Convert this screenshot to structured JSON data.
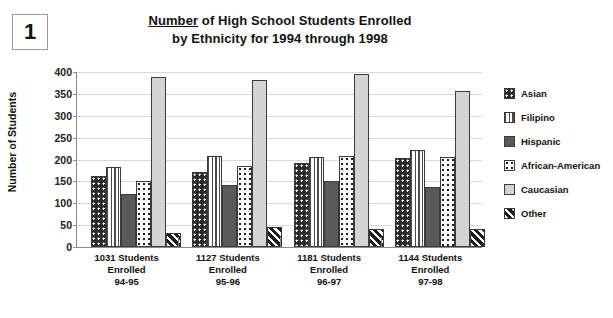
{
  "figure": {
    "number": "1"
  },
  "title": {
    "underlined_word": "Number",
    "line1_rest": " of High School Students Enrolled",
    "line2": "by Ethnicity for 1994 through 1998",
    "full": "Number of High School Students Enrolled by Ethnicity for 1994 through 1998"
  },
  "axes": {
    "ylabel": "Number of Students",
    "yticks": [
      "400",
      "350",
      "300",
      "250",
      "200",
      "150",
      "100",
      "50",
      "0"
    ]
  },
  "legend": {
    "position": "right",
    "items": [
      {
        "label": "Asian",
        "pattern": "dark-with-white-dots",
        "swatch_class": "p-asian"
      },
      {
        "label": "Filipino",
        "pattern": "vertical-stripes",
        "swatch_class": "p-filipino"
      },
      {
        "label": "Hispanic",
        "pattern": "solid-dark-gray",
        "swatch_class": "p-hispanic"
      },
      {
        "label": "African-American",
        "pattern": "white-with-black-dots",
        "swatch_class": "p-african"
      },
      {
        "label": "Caucasian",
        "pattern": "solid-light-gray",
        "swatch_class": "p-caucasian"
      },
      {
        "label": "Other",
        "pattern": "black-diagonal-stripes",
        "swatch_class": "p-other"
      }
    ]
  },
  "xlabels": [
    "1031 Students\nEnrolled\n94-95",
    "1127 Students\nEnrolled\n95-96",
    "1181 Students\nEnrolled\n96-97",
    "1144 Students\nEnrolled\n97-98"
  ],
  "chart_data": {
    "type": "bar",
    "title": "Number of High School Students Enrolled by Ethnicity for 1994 through 1998",
    "xlabel": "",
    "ylabel": "Number of Students",
    "ylim": [
      0,
      400
    ],
    "ytick_step": 50,
    "grid": true,
    "legend_position": "right",
    "categories": [
      "1031 Students Enrolled 94-95",
      "1127 Students Enrolled 95-96",
      "1181 Students Enrolled 96-97",
      "1144 Students Enrolled 97-98"
    ],
    "category_totals": [
      1031,
      1127,
      1181,
      1144
    ],
    "school_years": [
      "94-95",
      "95-96",
      "96-97",
      "97-98"
    ],
    "series": [
      {
        "name": "Asian",
        "values": [
          162,
          172,
          193,
          203
        ]
      },
      {
        "name": "Filipino",
        "values": [
          182,
          209,
          205,
          221
        ]
      },
      {
        "name": "Hispanic",
        "values": [
          122,
          142,
          152,
          137
        ]
      },
      {
        "name": "African-American",
        "values": [
          150,
          185,
          209,
          206
        ]
      },
      {
        "name": "Caucasian",
        "values": [
          388,
          382,
          396,
          357
        ]
      },
      {
        "name": "Other",
        "values": [
          32,
          46,
          42,
          42
        ]
      }
    ]
  }
}
